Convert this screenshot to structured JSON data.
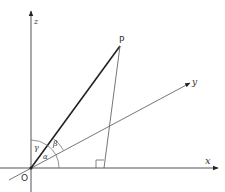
{
  "diagram": {
    "colors": {
      "background": "#ffffff",
      "line": "#444444",
      "vector": "#222222",
      "label": "#333333"
    },
    "origin": {
      "label": "O",
      "x": 31,
      "y": 168
    },
    "axes": [
      {
        "name": "x",
        "label": "x",
        "from": [
          0,
          168
        ],
        "to": [
          218,
          168
        ]
      },
      {
        "name": "y",
        "label": "y",
        "from": [
          10,
          180
        ],
        "to": [
          190,
          83
        ]
      },
      {
        "name": "z",
        "label": "z",
        "from": [
          31,
          192
        ],
        "to": [
          31,
          10
        ]
      }
    ],
    "point": {
      "label": "P",
      "x": 120,
      "y": 46
    },
    "foot": {
      "x": 104,
      "y": 168
    },
    "y_intersection": {
      "x": 109,
      "y": 123
    },
    "right_angle_marker": {
      "x": 96,
      "y": 160,
      "size": 8
    },
    "angles": [
      {
        "symbol": "α",
        "label_x": 43,
        "label_y": 154,
        "description": "angle between OP and x-axis"
      },
      {
        "symbol": "β",
        "label_x": 55,
        "label_y": 144,
        "description": "angle between OP and y-axis"
      },
      {
        "symbol": "γ",
        "label_x": 36,
        "label_y": 150,
        "description": "angle between OP and z-axis"
      }
    ]
  }
}
